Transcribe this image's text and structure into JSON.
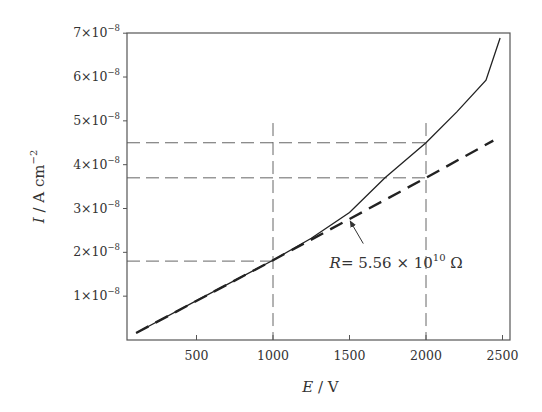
{
  "chart_data": {
    "type": "line",
    "title": "",
    "xlabel": {
      "var": "E",
      "unit": "V"
    },
    "ylabel": {
      "var": "I",
      "unit": "A cm",
      "unit_exp": "−2"
    },
    "xlim": [
      50,
      2560
    ],
    "ylim": [
      0,
      7e-08
    ],
    "grid": false,
    "legend": null,
    "x_ticks": [
      {
        "value": 500,
        "label": "500"
      },
      {
        "value": 1000,
        "label": "1000"
      },
      {
        "value": 1500,
        "label": "1500"
      },
      {
        "value": 2000,
        "label": "2000"
      },
      {
        "value": 2500,
        "label": "2500"
      }
    ],
    "y_ticks": [
      {
        "value": 1e-08,
        "mant": "1",
        "exp": "−8"
      },
      {
        "value": 2e-08,
        "mant": "2",
        "exp": "−8"
      },
      {
        "value": 3e-08,
        "mant": "3",
        "exp": "−8"
      },
      {
        "value": 4e-08,
        "mant": "4",
        "exp": "−8"
      },
      {
        "value": 5e-08,
        "mant": "5",
        "exp": "−8"
      },
      {
        "value": 6e-08,
        "mant": "6",
        "exp": "−8"
      },
      {
        "value": 7e-08,
        "mant": "7",
        "exp": "−8"
      }
    ],
    "series": [
      {
        "name": "measured current",
        "style": "solid",
        "x": [
          105,
          500,
          1000,
          1250,
          1500,
          1732,
          2000,
          2200,
          2392,
          2484
        ],
        "y": [
          1.6e-09,
          9e-09,
          1.82e-08,
          2.32e-08,
          2.91e-08,
          3.7e-08,
          4.5e-08,
          5.2e-08,
          5.93e-08,
          6.89e-08
        ]
      },
      {
        "name": "ohmic fit",
        "style": "dashed",
        "x": [
          105,
          1000,
          2000,
          2440
        ],
        "y": [
          1.6e-09,
          1.82e-08,
          3.7e-08,
          4.55e-08
        ]
      }
    ],
    "reference_lines": [
      {
        "orientation": "vertical",
        "x": 1000,
        "y_range": [
          0,
          4.95e-08
        ]
      },
      {
        "orientation": "vertical",
        "x": 2000,
        "y_range": [
          0,
          4.95e-08
        ]
      },
      {
        "orientation": "horizontal",
        "y": 4.5e-08,
        "x_range": [
          50,
          2000
        ]
      },
      {
        "orientation": "horizontal",
        "y": 3.7e-08,
        "x_range": [
          50,
          2000
        ]
      },
      {
        "orientation": "horizontal",
        "y": 1.8e-08,
        "x_range": [
          50,
          1000
        ]
      }
    ],
    "annotations": [
      {
        "text_var": "R",
        "text_value": "= 5.56 × 10",
        "text_exp": "10",
        "text_unit": " Ω",
        "arrow_to": {
          "x": 1505,
          "y": 2.71e-08
        },
        "arrow_from": {
          "x": 1590,
          "y": 2.2e-08
        },
        "text_at": {
          "x": 1370,
          "y": 1.65e-08
        }
      }
    ]
  }
}
